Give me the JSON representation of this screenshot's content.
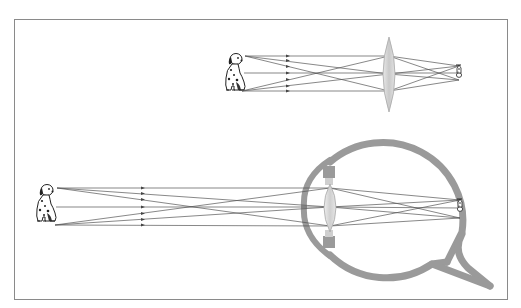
{
  "figure": {
    "panels": [
      {
        "id": "top",
        "label": "Convex lens forming an inverted, reduced image",
        "object": "dog",
        "lens": "biconvex-lens",
        "image": "inverted-dog-image"
      },
      {
        "id": "bottom",
        "label": "Eye lens forming an inverted, reduced image on the retina",
        "object": "dog",
        "lens": "eye-crystalline-lens",
        "image": "inverted-dog-image-on-retina",
        "structures": [
          "cornea",
          "ciliary-body",
          "zonules",
          "eye-lens",
          "retina",
          "optic-nerve"
        ]
      }
    ],
    "colors": {
      "frame": "#8a8a8a",
      "eye_wall": "#9a9a9a",
      "ray": "#555555",
      "lens_fill": "#d4d4d4",
      "lens_edge": "#a8a8a8",
      "dog": "#222222"
    },
    "icons": [
      "dog-icon",
      "lens-icon",
      "eye-icon",
      "arrow-icon"
    ]
  }
}
